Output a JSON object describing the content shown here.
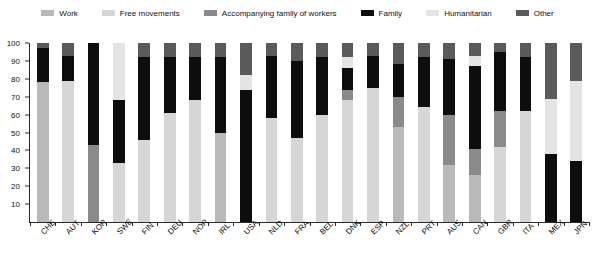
{
  "legend": {
    "position": "top-center",
    "items": [
      {
        "label": "Work",
        "color": "#b9b9b9",
        "key": "work"
      },
      {
        "label": "Free movements",
        "color": "#d6d6d6",
        "key": "free_movements"
      },
      {
        "label": "Accompanying family of workers",
        "color": "#8a8a8a",
        "key": "accompanying_family"
      },
      {
        "label": "Family",
        "color": "#0d0d0d",
        "key": "family"
      },
      {
        "label": "Humanitarian",
        "color": "#e4e4e4",
        "key": "humanitarian"
      },
      {
        "label": "Other",
        "color": "#5a5a5a",
        "key": "other"
      }
    ]
  },
  "axes": {
    "y_ticks": [
      100,
      90,
      80,
      70,
      60,
      50,
      40,
      30,
      20,
      10
    ],
    "y_min": 0,
    "y_max": 100,
    "grid": false
  },
  "chart_data": {
    "type": "bar",
    "title": "",
    "subtitle": "",
    "xlabel": "",
    "ylabel": "",
    "ylim": [
      0,
      100
    ],
    "stacked": true,
    "stack_order": [
      "work",
      "free_movements",
      "accompanying_family",
      "family",
      "humanitarian",
      "other"
    ],
    "categories": [
      "CHE",
      "AUT",
      "KOR",
      "SWE",
      "FIN",
      "DEU",
      "NOR",
      "IRL",
      "USA",
      "NLD",
      "FRA",
      "BEL",
      "DNK",
      "ESP",
      "NZL",
      "PRT",
      "AUS",
      "CAN",
      "GBR",
      "ITA",
      "MEX",
      "JPN"
    ],
    "series": [
      {
        "name": "Work",
        "color": "#b9b9b9",
        "values": [
          78,
          0,
          0,
          0,
          0,
          0,
          0,
          50,
          0,
          0,
          0,
          0,
          0,
          0,
          53,
          0,
          32,
          26,
          0,
          0,
          0,
          0
        ]
      },
      {
        "name": "Free movements",
        "color": "#d6d6d6",
        "values": [
          0,
          79,
          0,
          33,
          46,
          61,
          68,
          0,
          0,
          58,
          47,
          60,
          68,
          75,
          0,
          64,
          0,
          0,
          42,
          62,
          0,
          0
        ]
      },
      {
        "name": "Accompanying family of workers",
        "color": "#8a8a8a",
        "values": [
          0,
          0,
          43,
          0,
          0,
          0,
          0,
          0,
          0,
          0,
          0,
          0,
          6,
          0,
          17,
          0,
          28,
          15,
          20,
          0,
          0,
          0
        ]
      },
      {
        "name": "Family",
        "color": "#0d0d0d",
        "values": [
          19,
          14,
          57,
          35,
          46,
          31,
          24,
          42,
          74,
          35,
          43,
          32,
          12,
          18,
          18,
          28,
          31,
          46,
          33,
          30,
          38,
          34
        ]
      },
      {
        "name": "Humanitarian",
        "color": "#e4e4e4",
        "values": [
          0,
          0,
          0,
          32,
          0,
          0,
          0,
          0,
          8,
          0,
          0,
          0,
          6,
          0,
          0,
          0,
          0,
          6,
          0,
          0,
          31,
          45
        ]
      },
      {
        "name": "Other",
        "color": "#5a5a5a",
        "values": [
          3,
          7,
          0,
          0,
          8,
          8,
          8,
          8,
          18,
          7,
          10,
          8,
          8,
          7,
          12,
          8,
          9,
          7,
          5,
          8,
          31,
          21
        ]
      }
    ]
  },
  "xaxis_labels": [
    "CHE",
    "AUT",
    "KOR",
    "SWE",
    "FIN",
    "DEU",
    "NOR",
    "IRL",
    "USA",
    "NLD",
    "FRA",
    "BEL",
    "DNK",
    "ESP",
    "NZL",
    "PRT",
    "AUS",
    "CAN",
    "GBR",
    "ITA",
    "MEX",
    "JPN"
  ]
}
